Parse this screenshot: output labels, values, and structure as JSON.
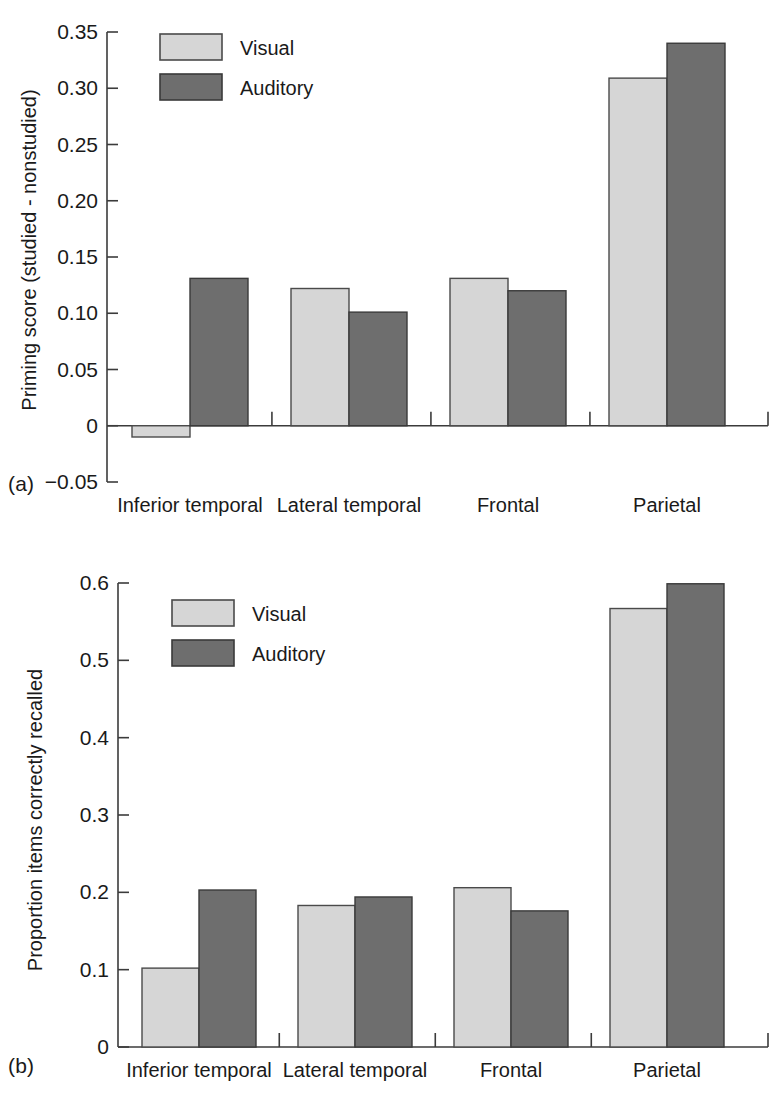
{
  "figure": {
    "panel_a_tag": "(a)",
    "panel_b_tag": "(b)"
  },
  "legend": {
    "visual_label": "Visual",
    "auditory_label": "Auditory"
  },
  "chart_data": [
    {
      "type": "bar",
      "panel": "(a)",
      "title": "",
      "xlabel": "",
      "ylabel": "Priming score (studied - nonstudied)",
      "categories": [
        "Inferior temporal",
        "Lateral temporal",
        "Frontal",
        "Parietal"
      ],
      "series": [
        {
          "name": "Visual",
          "values": [
            -0.01,
            0.122,
            0.131,
            0.309
          ]
        },
        {
          "name": "Auditory",
          "values": [
            0.131,
            0.101,
            0.12,
            0.34
          ]
        }
      ],
      "ylim": [
        -0.05,
        0.35
      ],
      "yticks": [
        -0.05,
        0,
        0.05,
        0.1,
        0.15,
        0.2,
        0.25,
        0.3,
        0.35
      ],
      "ytick_labels": [
        "−0.05",
        "0",
        "0.05",
        "0.10",
        "0.15",
        "0.20",
        "0.25",
        "0.30",
        "0.35"
      ],
      "grid": false,
      "legend_position": "top-left"
    },
    {
      "type": "bar",
      "panel": "(b)",
      "title": "",
      "xlabel": "",
      "ylabel": "Proportion items correctly recalled",
      "categories": [
        "Inferior temporal",
        "Lateral temporal",
        "Frontal",
        "Parietal"
      ],
      "series": [
        {
          "name": "Visual",
          "values": [
            0.102,
            0.183,
            0.206,
            0.567
          ]
        },
        {
          "name": "Auditory",
          "values": [
            0.203,
            0.194,
            0.176,
            0.599
          ]
        }
      ],
      "ylim": [
        0,
        0.6
      ],
      "yticks": [
        0,
        0.1,
        0.2,
        0.3,
        0.4,
        0.5,
        0.6
      ],
      "ytick_labels": [
        "0",
        "0.1",
        "0.2",
        "0.3",
        "0.4",
        "0.5",
        "0.6"
      ],
      "grid": false,
      "legend_position": "top-left"
    }
  ]
}
